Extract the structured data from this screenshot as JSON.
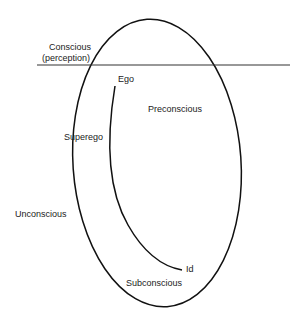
{
  "diagram": {
    "labels": {
      "conscious": "Conscious",
      "perception": "(perception)",
      "ego": "Ego",
      "preconscious": "Preconscious",
      "superego": "Superego",
      "unconscious": "Unconscious",
      "subconscious": "Subconscious",
      "id": "Id"
    },
    "colors": {
      "stroke": "#111111",
      "text": "#222222",
      "background": "#ffffff"
    }
  }
}
